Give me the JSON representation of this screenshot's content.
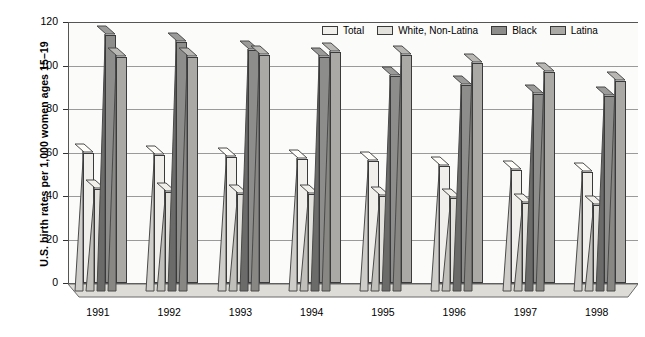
{
  "chart_data": {
    "type": "bar",
    "title": "",
    "xlabel": "",
    "ylabel": "U.S. birth rates per 1,000 women ages 15–19",
    "ylim": [
      0,
      120
    ],
    "yticks": [
      0,
      20,
      40,
      60,
      80,
      100,
      120
    ],
    "grid": true,
    "legend_position": "top-right",
    "categories": [
      "1991",
      "1992",
      "1993",
      "1994",
      "1995",
      "1996",
      "1997",
      "1998"
    ],
    "series": [
      {
        "name": "Total",
        "color": "#f1efeb",
        "values": [
          60,
          59,
          58,
          57,
          56,
          54,
          52,
          51
        ]
      },
      {
        "name": "White, Non-Latina",
        "color": "#e3e1dc",
        "values": [
          43,
          42,
          41,
          41,
          40,
          39,
          37,
          36
        ]
      },
      {
        "name": "Black",
        "color": "#8d8d8c",
        "values": [
          114,
          111,
          107,
          104,
          95,
          91,
          87,
          86
        ]
      },
      {
        "name": "Latina",
        "color": "#aaa9a5",
        "values": [
          104,
          104,
          105,
          106,
          105,
          101,
          97,
          93
        ]
      }
    ]
  },
  "axis": {
    "y_tick_labels": [
      "120",
      "100",
      "80",
      "60",
      "40",
      "20",
      "0"
    ],
    "y_title": "U.S. birth rates per 1,000 women ages 15–19",
    "x_tick_labels": [
      "1991",
      "1992",
      "1993",
      "1994",
      "1995",
      "1996",
      "1997",
      "1998"
    ]
  },
  "legend": {
    "items": [
      {
        "label": "Total"
      },
      {
        "label": "White, Non-Latina"
      },
      {
        "label": "Black"
      },
      {
        "label": "Latina"
      }
    ]
  }
}
